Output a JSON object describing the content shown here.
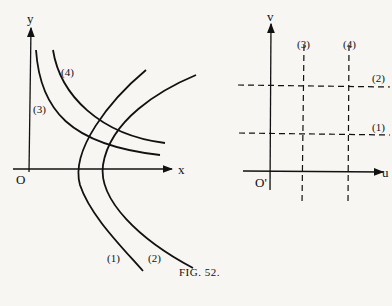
{
  "figure": {
    "caption": "FIG. 52.",
    "left_plot": {
      "x_axis_label": "x",
      "y_axis_label": "y",
      "origin_label": "O",
      "curves": [
        {
          "id": "1",
          "label": "(1)"
        },
        {
          "id": "2",
          "label": "(2)"
        },
        {
          "id": "3",
          "label": "(3)"
        },
        {
          "id": "4",
          "label": "(4)"
        }
      ]
    },
    "right_plot": {
      "x_axis_label": "u",
      "y_axis_label": "v",
      "origin_label": "O'",
      "lines": [
        {
          "id": "1",
          "label": "(1)",
          "orientation": "horizontal"
        },
        {
          "id": "2",
          "label": "(2)",
          "orientation": "horizontal"
        },
        {
          "id": "3",
          "label": "(3)",
          "orientation": "vertical"
        },
        {
          "id": "4",
          "label": "(4)",
          "orientation": "vertical"
        }
      ]
    }
  }
}
